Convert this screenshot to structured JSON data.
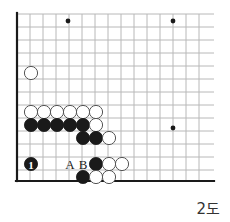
{
  "figure": {
    "caption": "2도",
    "kind": "go-board-diagram"
  },
  "board": {
    "origin_x": 17,
    "origin_y": 14,
    "spacing": 13,
    "cols": 15,
    "rows": 13,
    "edge_left_x": 17,
    "edge_bottom_y": 181,
    "edge_right_x": 214,
    "edge_top_y": 14,
    "line_color": "#b8b8b8",
    "edge_color": "#1a1a1a",
    "black_color": "#1a1a1a",
    "white_color": "#ffffff",
    "stone_radius": 6.6,
    "star_points": [
      {
        "x": 68,
        "y": 21
      },
      {
        "x": 173,
        "y": 21
      },
      {
        "x": 173,
        "y": 128
      }
    ],
    "stones": [
      {
        "color": "white",
        "x": 31,
        "y": 73,
        "label": ""
      },
      {
        "color": "white",
        "x": 31,
        "y": 112,
        "label": ""
      },
      {
        "color": "white",
        "x": 44,
        "y": 112,
        "label": ""
      },
      {
        "color": "white",
        "x": 57,
        "y": 112,
        "label": ""
      },
      {
        "color": "white",
        "x": 70,
        "y": 112,
        "label": ""
      },
      {
        "color": "white",
        "x": 83,
        "y": 112,
        "label": ""
      },
      {
        "color": "white",
        "x": 96,
        "y": 112,
        "label": ""
      },
      {
        "color": "black",
        "x": 31,
        "y": 125,
        "label": ""
      },
      {
        "color": "black",
        "x": 44,
        "y": 125,
        "label": ""
      },
      {
        "color": "black",
        "x": 57,
        "y": 125,
        "label": ""
      },
      {
        "color": "black",
        "x": 70,
        "y": 125,
        "label": ""
      },
      {
        "color": "black",
        "x": 83,
        "y": 125,
        "label": ""
      },
      {
        "color": "white",
        "x": 96,
        "y": 125,
        "label": ""
      },
      {
        "color": "black",
        "x": 83,
        "y": 138,
        "label": ""
      },
      {
        "color": "black",
        "x": 96,
        "y": 138,
        "label": ""
      },
      {
        "color": "white",
        "x": 109,
        "y": 138,
        "label": ""
      },
      {
        "color": "black",
        "x": 31,
        "y": 164,
        "label": "1"
      },
      {
        "color": "black",
        "x": 96,
        "y": 164,
        "label": ""
      },
      {
        "color": "white",
        "x": 109,
        "y": 164,
        "label": ""
      },
      {
        "color": "white",
        "x": 122,
        "y": 164,
        "label": ""
      },
      {
        "color": "black",
        "x": 83,
        "y": 177,
        "label": ""
      },
      {
        "color": "white",
        "x": 96,
        "y": 177,
        "label": ""
      },
      {
        "color": "white",
        "x": 109,
        "y": 177,
        "label": ""
      }
    ],
    "point_labels": [
      {
        "text": "A",
        "x": 70,
        "y": 164
      },
      {
        "text": "B",
        "x": 83,
        "y": 164
      }
    ]
  }
}
